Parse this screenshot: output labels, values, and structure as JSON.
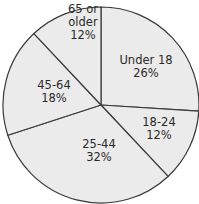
{
  "chart_data": {
    "type": "pie",
    "title": "",
    "categories": [
      "Under 18",
      "18-24",
      "25-44",
      "45-64",
      "65 or older"
    ],
    "values": [
      26,
      12,
      32,
      18,
      12
    ],
    "unit": "%",
    "labels": [
      {
        "lines": [
          "Under 18",
          "26%"
        ]
      },
      {
        "lines": [
          "18-24",
          "12%"
        ]
      },
      {
        "lines": [
          "25-44",
          "32%"
        ]
      },
      {
        "lines": [
          "45-64",
          "18%"
        ]
      },
      {
        "lines": [
          "65 or",
          "older",
          "12%"
        ]
      }
    ],
    "colors": {
      "fill": "#ebebeb",
      "stroke": "#3a3a3a",
      "text": "#2a2a2a"
    },
    "start_angle_deg": 0,
    "direction": "clockwise",
    "legend": "none"
  }
}
